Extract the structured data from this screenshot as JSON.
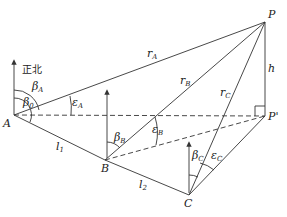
{
  "diagram": {
    "points": {
      "A": "A",
      "B": "B",
      "C": "C",
      "P": "P",
      "P_prime": "P'"
    },
    "north_label": "正北",
    "height_label": "h",
    "ranges": {
      "rA": {
        "main": "r",
        "sub": "A"
      },
      "rB": {
        "main": "r",
        "sub": "B"
      },
      "rC": {
        "main": "r",
        "sub": "C"
      }
    },
    "baselines": {
      "l1": {
        "main": "l",
        "sub": "1"
      },
      "l2": {
        "main": "l",
        "sub": "2"
      }
    },
    "azimuths": {
      "betaA": {
        "main": "β",
        "sub": "A"
      },
      "beta0": {
        "main": "β",
        "sub": "0"
      },
      "betaB": {
        "main": "β",
        "sub": "B"
      },
      "betaC": {
        "main": "β",
        "sub": "C"
      }
    },
    "elevations": {
      "epsA": {
        "main": "ε",
        "sub": "A"
      },
      "epsB": {
        "main": "ε",
        "sub": "B"
      },
      "epsC": {
        "main": "ε",
        "sub": "C"
      }
    },
    "line_color": "#333333"
  }
}
